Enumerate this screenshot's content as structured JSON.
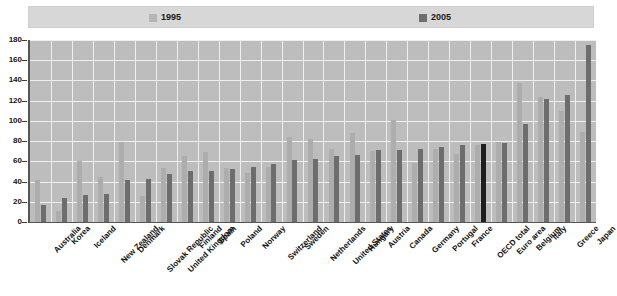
{
  "legend": {
    "entries": [
      {
        "label": "1995",
        "color": "#adadad",
        "swatch_name": "legend-swatch-1995"
      },
      {
        "label": "2005",
        "color": "#6d6d6d",
        "swatch_name": "legend-swatch-2005"
      }
    ]
  },
  "axis": {
    "y_ticks": [
      "0",
      "20",
      "40",
      "60",
      "80",
      "100",
      "120",
      "140",
      "160",
      "180"
    ],
    "y_min": 0,
    "y_max": 180,
    "y_step": 20
  },
  "colors": {
    "series_1995": "#adadad",
    "series_2005": "#6d6d6d",
    "highlight": "#1e1e1e",
    "plot_background": "#bdbdbd",
    "gridline": "#efefef",
    "legend_background": "#d7d7d7",
    "axis": "#555555",
    "text": "#101010"
  },
  "chart_data": {
    "type": "bar",
    "title": "",
    "subtitle": "",
    "xlabel": "",
    "ylabel": "",
    "ylim": [
      0,
      180
    ],
    "ytick_step": 20,
    "grid": true,
    "legend_position": "top",
    "highlighted_category": "OECD total",
    "categories": [
      "Australia",
      "Korea",
      "Iceland",
      "New Zealand",
      "Denmark",
      "Slovak Republic",
      "United Kingdom",
      "Finland",
      "Spain",
      "Poland",
      "Norway",
      "Switzerland",
      "Sweden",
      "Netherlands",
      "United States",
      "Hungary",
      "Austria",
      "Canada",
      "Germany",
      "Portugal",
      "France",
      "OECD total",
      "Euro area",
      "Belgium",
      "Italy",
      "Greece",
      "Japan"
    ],
    "series": [
      {
        "name": "1995",
        "color": "#adadad",
        "values": [
          42,
          11,
          60,
          45,
          79,
          26,
          53,
          65,
          69,
          53,
          48,
          54,
          84,
          82,
          72,
          88,
          70,
          101,
          58,
          72,
          67,
          76,
          79,
          137,
          124,
          110,
          89
        ]
      },
      {
        "name": "2005",
        "color": "#6d6d6d",
        "values": [
          17,
          24,
          27,
          28,
          42,
          43,
          47,
          50,
          50,
          52,
          54,
          57,
          61,
          62,
          65,
          66,
          71,
          71,
          72,
          74,
          76,
          77,
          78,
          97,
          122,
          126,
          175
        ]
      }
    ]
  }
}
